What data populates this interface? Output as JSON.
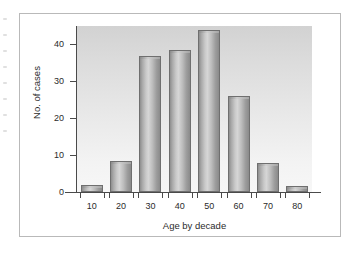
{
  "chart_data": {
    "type": "bar",
    "title": "",
    "xlabel": "Age by decade",
    "ylabel": "No. of cases",
    "categories": [
      "10",
      "20",
      "30",
      "40",
      "50",
      "60",
      "70",
      "80"
    ],
    "values": [
      2,
      8.5,
      37,
      38.5,
      44,
      26,
      8,
      1.5
    ],
    "yticks": [
      "0",
      "10",
      "20",
      "30",
      "40"
    ],
    "ytick_values": [
      0,
      10,
      20,
      30,
      40
    ],
    "ylim": [
      0,
      45
    ],
    "grid": false,
    "legend": null,
    "bar_style": "3d-cylinder-gray",
    "plot_background": "#e9e9e9",
    "bar_color": "#b0b0b0",
    "axis_color": "#4a4a4a",
    "frame_color": "#b9b9b9"
  }
}
